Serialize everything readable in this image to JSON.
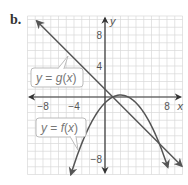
{
  "part_label": "b.",
  "colors": {
    "grid": "#d9d9d9",
    "axis": "#333333",
    "curve": "#555555",
    "label_border": "#bbbbbb",
    "label_text": "#777777"
  },
  "chart_data": {
    "type": "line",
    "title": "",
    "xlabel": "x",
    "ylabel": "y",
    "xlim": [
      -10,
      10
    ],
    "ylim": [
      -10,
      10
    ],
    "grid": true,
    "grid_step": 2,
    "x_ticks": [
      {
        "value": -8,
        "label": "−8"
      },
      {
        "value": -4,
        "label": "−4"
      },
      {
        "value": 8,
        "label": "8"
      }
    ],
    "y_ticks": [
      {
        "value": 8,
        "label": "8"
      },
      {
        "value": 4,
        "label": "4"
      },
      {
        "value": -8,
        "label": "−8"
      }
    ],
    "series": [
      {
        "name": "y = g(x)",
        "kind": "linear",
        "equation_estimate": "g(x) = -x + 1",
        "points": [
          [
            -8.8,
            9.8
          ],
          [
            -4,
            5
          ],
          [
            0,
            1
          ],
          [
            1,
            0
          ],
          [
            4,
            -3
          ],
          [
            7,
            -6
          ],
          [
            9.9,
            -8.9
          ]
        ],
        "arrows_both_ends": true
      },
      {
        "name": "y = f(x)",
        "kind": "quadratic",
        "equation_estimate": "f(x) = -0.25(x - 1)(x - 3)",
        "vertex": [
          2,
          0.25
        ],
        "points": [
          [
            -4.4,
            -10.1
          ],
          [
            -2,
            -3.75
          ],
          [
            0,
            -0.75
          ],
          [
            1,
            0
          ],
          [
            2,
            0.25
          ],
          [
            3,
            0
          ],
          [
            5,
            -2
          ],
          [
            7,
            -6
          ],
          [
            8.1,
            -9.1
          ]
        ],
        "arrows_both_ends": true
      }
    ],
    "intersections": [
      [
        1,
        0
      ],
      [
        7,
        -6
      ]
    ],
    "annotations": [
      {
        "text_parts": [
          "y",
          " = ",
          "g",
          "(",
          "x",
          ")"
        ],
        "attached_to": "g"
      },
      {
        "text_parts": [
          "y",
          " = ",
          "f",
          "(",
          "x",
          ")"
        ],
        "attached_to": "f"
      }
    ]
  }
}
